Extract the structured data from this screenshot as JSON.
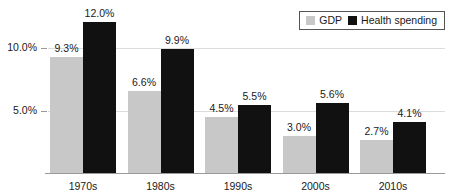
{
  "chart_data": {
    "type": "bar",
    "title": "",
    "xlabel": "",
    "ylabel": "",
    "categories": [
      "1970s",
      "1980s",
      "1990s",
      "2000s",
      "2010s"
    ],
    "series": [
      {
        "name": "GDP",
        "color": "#c8c8c8",
        "values": [
          9.3,
          6.6,
          4.5,
          3.0,
          2.7
        ],
        "labels": [
          "9.3%",
          "6.6%",
          "4.5%",
          "3.0%",
          "2.7%"
        ]
      },
      {
        "name": "Health spending",
        "color": "#111111",
        "values": [
          12.0,
          9.9,
          5.5,
          5.6,
          4.1
        ],
        "labels": [
          "12.0%",
          "9.9%",
          "5.5%",
          "5.6%",
          "4.1%"
        ]
      }
    ],
    "ylim": [
      0,
      13.3
    ],
    "yticks": [
      5.0,
      10.0
    ],
    "ytick_labels": [
      "5.0%",
      "10.0%"
    ],
    "grid": true,
    "legend_position": "top-right",
    "legend_entries": [
      "GDP",
      "Health spending"
    ]
  }
}
